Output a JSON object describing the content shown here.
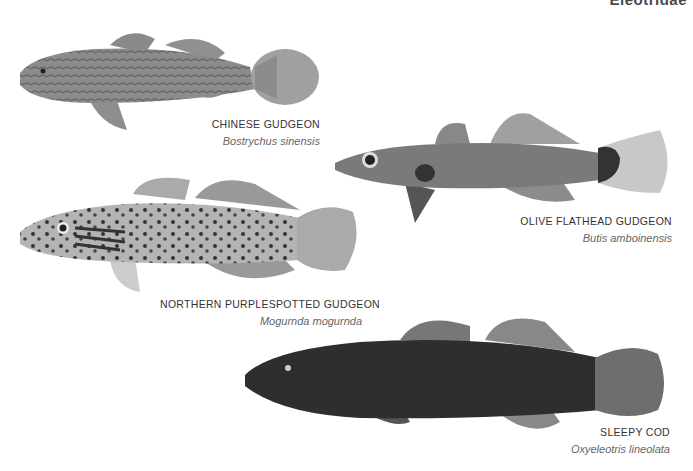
{
  "header": {
    "family_label": "Eleotridae"
  },
  "species": [
    {
      "common_name": "Chinese Gudgeon",
      "scientific_name": "Bostrychus sinensis",
      "tone": "#8a8a8a"
    },
    {
      "common_name": "Olive Flathead Gudgeon",
      "scientific_name": "Butis amboinensis",
      "tone": "#777777"
    },
    {
      "common_name": "Northern Purplespotted Gudgeon",
      "scientific_name": "Mogurnda mogurnda",
      "tone": "#a8a8a8"
    },
    {
      "common_name": "Sleepy Cod",
      "scientific_name": "Oxyeleotris lineolata",
      "tone": "#2e2e2e"
    }
  ]
}
